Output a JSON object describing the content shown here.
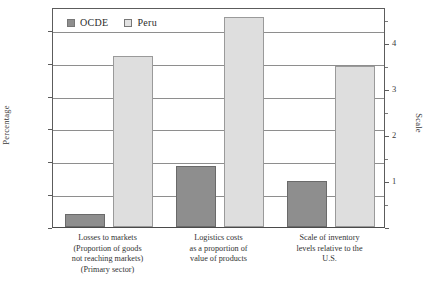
{
  "chart_data": {
    "type": "bar",
    "title": "",
    "xlabel": "",
    "ylabel": "Percentage",
    "y2label": "Scale",
    "ylim": [
      0,
      33.5
    ],
    "y2lim": [
      0,
      4.79
    ],
    "yticks": [
      0,
      5,
      10,
      15,
      20,
      25,
      30
    ],
    "y2ticks": [
      1,
      2,
      3,
      4
    ],
    "grid": true,
    "legend_position": "top-left-inside",
    "categories": [
      "Losses to markets (Proportion of goods not reaching markets) (Primary sector)",
      "Logistics costs as a proportion of value of products",
      "Scale of inventory levels relative to the U.S."
    ],
    "series": [
      {
        "name": "OCDE",
        "color": "#8e8e8e",
        "values": [
          2.0,
          9.3,
          7.0
        ]
      },
      {
        "name": "Peru",
        "color": "#dedede",
        "values": [
          26.1,
          32.0,
          24.5
        ]
      }
    ]
  },
  "legend": {
    "items": [
      {
        "label": "OCDE",
        "swatch": "legend-swatch-ocde"
      },
      {
        "label": "Peru",
        "swatch": "legend-swatch-peru"
      }
    ]
  },
  "axes": {
    "left": {
      "title": "Percentage",
      "ticks": [
        "0",
        "5",
        "10",
        "15",
        "20",
        "25",
        "30"
      ]
    },
    "right": {
      "title": "Scale",
      "ticks": [
        "1",
        "2",
        "3",
        "4"
      ]
    }
  },
  "categories_lines": [
    [
      "Losses to markets",
      "(Proportion of goods",
      "not reaching markets)",
      "(Primary sector)"
    ],
    [
      "Logistics costs",
      "as a proportion of",
      "value of products"
    ],
    [
      "Scale of inventory",
      "levels relative to the",
      "U.S."
    ]
  ]
}
